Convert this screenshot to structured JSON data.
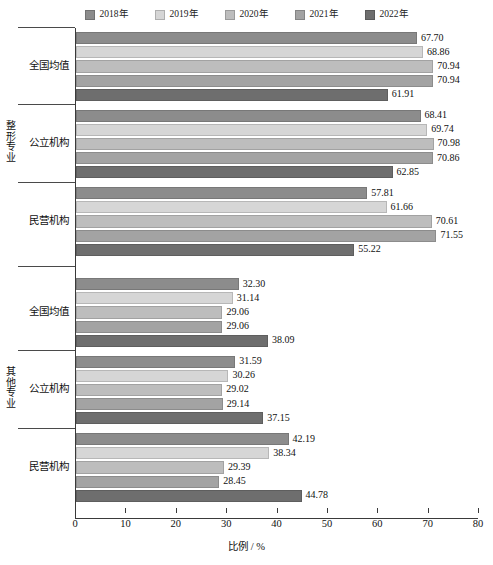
{
  "legend": {
    "position": "top-center",
    "items": [
      {
        "label": "2018年",
        "color": "#8c8c8c"
      },
      {
        "label": "2019年",
        "color": "#d6d6d6"
      },
      {
        "label": "2020年",
        "color": "#bdbdbd"
      },
      {
        "label": "2021年",
        "color": "#a3a3a3"
      },
      {
        "label": "2022年",
        "color": "#6e6e6e"
      }
    ]
  },
  "axis": {
    "x_title": "比例 / %",
    "x_ticks": [
      "0",
      "10",
      "20",
      "30",
      "40",
      "50",
      "60",
      "70",
      "80"
    ],
    "x_min": 0,
    "x_max": 80
  },
  "supercategories": [
    {
      "label": "整形专业"
    },
    {
      "label": "其他专业"
    }
  ],
  "categories": [
    "全国均值",
    "公立机构",
    "民营机构",
    "全国均值",
    "公立机构",
    "民营机构"
  ],
  "chart_data": {
    "type": "bar",
    "orientation": "horizontal",
    "title": "",
    "xlabel": "比例 / %",
    "ylabel": "",
    "xlim": [
      0,
      80
    ],
    "grid": false,
    "legend_position": "top-center",
    "categories": [
      "整形专业 / 全国均值",
      "整形专业 / 公立机构",
      "整形专业 / 民营机构",
      "其他专业 / 全国均值",
      "其他专业 / 公立机构",
      "其他专业 / 民营机构"
    ],
    "series": [
      {
        "name": "2018年",
        "color": "#8c8c8c",
        "values": [
          67.7,
          68.41,
          57.81,
          32.3,
          31.59,
          42.19
        ]
      },
      {
        "name": "2019年",
        "color": "#d6d6d6",
        "values": [
          68.86,
          69.74,
          61.66,
          31.14,
          30.26,
          38.34
        ]
      },
      {
        "name": "2020年",
        "color": "#bdbdbd",
        "values": [
          70.94,
          70.98,
          70.61,
          29.06,
          29.02,
          29.39
        ]
      },
      {
        "name": "2021年",
        "color": "#a3a3a3",
        "values": [
          70.94,
          70.86,
          71.55,
          29.06,
          29.14,
          28.45
        ]
      },
      {
        "name": "2022年",
        "color": "#6e6e6e",
        "values": [
          61.91,
          62.85,
          55.22,
          38.09,
          37.15,
          44.78
        ]
      }
    ],
    "value_labels": [
      [
        "67.70",
        "68.86",
        "70.94",
        "70.94",
        "61.91"
      ],
      [
        "68.41",
        "69.74",
        "70.98",
        "70.86",
        "62.85"
      ],
      [
        "57.81",
        "61.66",
        "70.61",
        "71.55",
        "55.22"
      ],
      [
        "32.30",
        "31.14",
        "29.06",
        "29.06",
        "38.09"
      ],
      [
        "31.59",
        "30.26",
        "29.02",
        "29.14",
        "37.15"
      ],
      [
        "42.19",
        "38.34",
        "29.39",
        "28.45",
        "44.78"
      ]
    ]
  }
}
